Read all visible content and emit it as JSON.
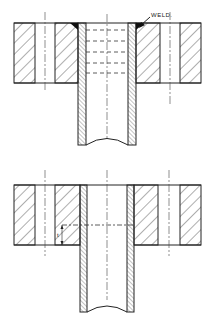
{
  "figures": [
    {
      "id": "top",
      "description": "Slip-on flange welded to pipe (section view)",
      "labels": {
        "weld": "WELD."
      }
    },
    {
      "id": "bottom",
      "description": "Flange with pipe inserted, showing insertion depth dimension",
      "labels": {
        "dimension": "t"
      }
    }
  ],
  "colors": {
    "line": "#222222",
    "background": "#ffffff"
  }
}
